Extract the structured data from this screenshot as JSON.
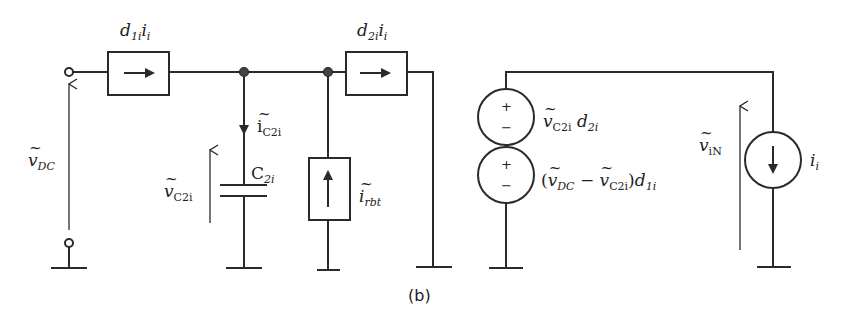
{
  "figure": {
    "caption": "(b)",
    "left_circuit": {
      "source_voltage": {
        "symbol": "v",
        "subscript": "DC",
        "tilde": true
      },
      "switch_source_1": {
        "label_main": "d",
        "label_sub": "1i",
        "label_tail": "i",
        "label_tail_sub": "i",
        "arrow_direction": "right"
      },
      "switch_source_2": {
        "label_main": "d",
        "label_sub": "2i",
        "label_tail": "i",
        "label_tail_sub": "i",
        "arrow_direction": "right"
      },
      "capacitor_current": {
        "symbol": "i",
        "subscript": "C2i",
        "tilde": true,
        "arrow_direction": "down"
      },
      "capacitor": {
        "symbol": "C",
        "subscript": "2i"
      },
      "capacitor_voltage": {
        "symbol": "v",
        "subscript": "C2i",
        "tilde": true
      },
      "ripple_current_source": {
        "symbol": "i",
        "subscript": "rbt",
        "tilde": true,
        "arrow_direction": "up"
      }
    },
    "right_circuit": {
      "voltage_source_top": {
        "label": "ṽC2i d2i",
        "symbol": "v",
        "subscript": "C2i",
        "factor": "d",
        "factor_sub": "2i",
        "plus": "+",
        "minus": "−"
      },
      "voltage_source_bottom": {
        "label": "(ṽDC − ṽC2i)d1i",
        "open": "(",
        "a": "v",
        "a_sub": "DC",
        "op": "−",
        "b": "v",
        "b_sub": "C2i",
        "close": ")",
        "factor": "d",
        "factor_sub": "1i",
        "plus": "+",
        "minus": "−"
      },
      "output_voltage": {
        "symbol": "v",
        "subscript": "iN",
        "tilde": true
      },
      "load_current_source": {
        "symbol": "i",
        "subscript": "i",
        "arrow_direction": "down"
      }
    }
  }
}
